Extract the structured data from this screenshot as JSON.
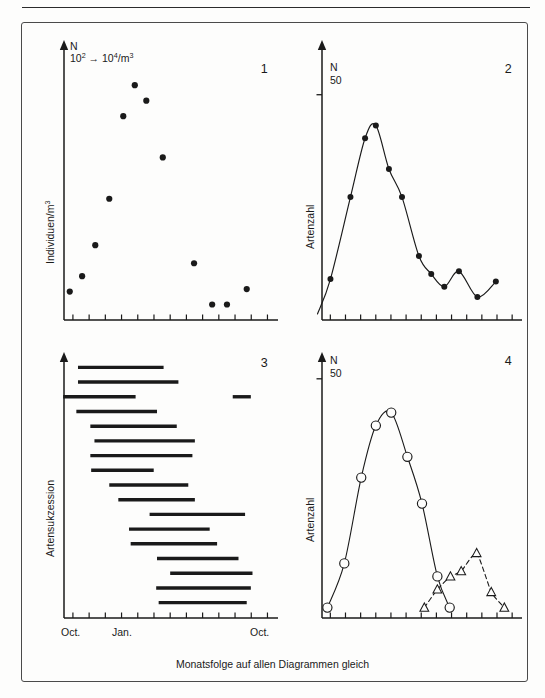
{
  "figure": {
    "caption": "Monatsfolge auf allen Diagrammen gleich"
  },
  "panels": {
    "p1": {
      "number": "1",
      "head_line1": "N",
      "head_line2_pre": "10",
      "head_line2_exp1": "2",
      "head_line2_arrow": "→",
      "head_line2_mid": "10",
      "head_line2_exp2": "4",
      "head_line2_post": "/m",
      "head_line2_exp3": "3",
      "ylabel_text": "Individuen/m",
      "ylabel_exp": "3"
    },
    "p2": {
      "number": "2",
      "head_n": "N",
      "head_tick": "50",
      "ylabel_text": "Artenzahl"
    },
    "p3": {
      "number": "3",
      "ylabel_text": "Artensukzession",
      "xticks": [
        {
          "label": "Oct.",
          "index": 0
        },
        {
          "label": "Jan.",
          "index": 3
        },
        {
          "label": "Oct.",
          "index": 12
        }
      ]
    },
    "p4": {
      "number": "4",
      "head_n": "N",
      "head_tick": "50",
      "ylabel_text": "Artenzahl"
    }
  },
  "chart_data": [
    {
      "id": "panel1",
      "type": "scatter",
      "title": "1",
      "xlabel": "",
      "ylabel": "Individuen/m3",
      "axis_note": "N  10^2 -> 10^4/m3",
      "xlim": [
        0,
        13
      ],
      "ylim": [
        0,
        100
      ],
      "grid": false,
      "legend": "none",
      "n_xticks": 13,
      "x": [
        0.35,
        1.1,
        1.9,
        2.75,
        3.6,
        4.3,
        5.0,
        6.0,
        7.9,
        9.0,
        9.9,
        11.1
      ],
      "values": [
        11,
        17,
        29,
        47,
        79,
        91,
        85,
        63,
        22,
        6,
        6,
        12
      ]
    },
    {
      "id": "panel2",
      "type": "line",
      "title": "2",
      "xlabel": "",
      "ylabel": "Artenzahl",
      "axis_tick_label": "50",
      "axis_note": "N",
      "xlim": [
        0,
        13
      ],
      "ylim": [
        0,
        100
      ],
      "grid": false,
      "legend": "none",
      "n_xticks": 13,
      "series": [
        {
          "name": "Artenzahl",
          "marker": "filled-circle",
          "line": "solid",
          "x": [
            0.55,
            1.85,
            2.8,
            3.5,
            4.35,
            5.2,
            6.3,
            7.1,
            7.95,
            8.9,
            10.1,
            11.3
          ],
          "values": [
            16,
            48,
            71,
            76,
            59,
            48,
            25,
            18,
            13,
            19,
            9,
            15
          ]
        }
      ]
    },
    {
      "id": "panel3",
      "type": "bar",
      "orientation": "horizontal-range",
      "title": "3",
      "xlabel": "",
      "ylabel": "Artensukzession",
      "xlim": [
        0,
        13
      ],
      "grid": false,
      "legend": "none",
      "n_xticks": 13,
      "xtick_labels": [
        "Oct.",
        "",
        "",
        "Jan.",
        "",
        "",
        "",
        "",
        "",
        "",
        "",
        "",
        "Oct."
      ],
      "rows": [
        {
          "index": 0,
          "segments": [
            [
              0.85,
              6.05
            ]
          ]
        },
        {
          "index": 1,
          "segments": [
            [
              0.85,
              6.95
            ]
          ]
        },
        {
          "index": 2,
          "segments": [
            [
              -0.05,
              4.35
            ],
            [
              10.25,
              11.35
            ]
          ]
        },
        {
          "index": 3,
          "segments": [
            [
              0.75,
              5.65
            ]
          ]
        },
        {
          "index": 4,
          "segments": [
            [
              1.6,
              6.85
            ]
          ]
        },
        {
          "index": 5,
          "segments": [
            [
              1.85,
              7.95
            ]
          ]
        },
        {
          "index": 6,
          "segments": [
            [
              1.6,
              7.8
            ]
          ]
        },
        {
          "index": 7,
          "segments": [
            [
              1.65,
              5.45
            ]
          ]
        },
        {
          "index": 8,
          "segments": [
            [
              2.75,
              7.55
            ]
          ]
        },
        {
          "index": 9,
          "segments": [
            [
              3.3,
              7.95
            ]
          ]
        },
        {
          "index": 10,
          "segments": [
            [
              5.2,
              11.0
            ]
          ]
        },
        {
          "index": 11,
          "segments": [
            [
              3.95,
              8.85
            ]
          ]
        },
        {
          "index": 12,
          "segments": [
            [
              4.05,
              9.3
            ]
          ]
        },
        {
          "index": 13,
          "segments": [
            [
              5.65,
              10.6
            ]
          ]
        },
        {
          "index": 14,
          "segments": [
            [
              6.45,
              11.45
            ]
          ]
        },
        {
          "index": 15,
          "segments": [
            [
              5.6,
              11.35
            ]
          ]
        },
        {
          "index": 16,
          "segments": [
            [
              5.75,
              11.1
            ]
          ]
        }
      ]
    },
    {
      "id": "panel4",
      "type": "line",
      "title": "4",
      "xlabel": "",
      "ylabel": "Artenzahl",
      "axis_tick_label": "50",
      "axis_note": "N",
      "xlim": [
        0,
        13
      ],
      "ylim": [
        0,
        100
      ],
      "grid": false,
      "legend": "none",
      "n_xticks": 13,
      "series": [
        {
          "name": "Artenzahl Serie A",
          "marker": "open-circle",
          "line": "solid",
          "x": [
            0.35,
            1.45,
            2.55,
            3.5,
            4.5,
            5.55,
            6.5,
            7.5,
            8.3
          ],
          "values": [
            4,
            21,
            54,
            74,
            79,
            62,
            44,
            16,
            4
          ]
        },
        {
          "name": "Artenzahl Serie B",
          "marker": "open-triangle",
          "line": "dashed",
          "x": [
            6.65,
            7.5,
            8.35,
            9.05,
            10.05,
            11.0,
            11.85
          ],
          "values": [
            4,
            11,
            16,
            18,
            25,
            10,
            4
          ]
        }
      ]
    }
  ]
}
